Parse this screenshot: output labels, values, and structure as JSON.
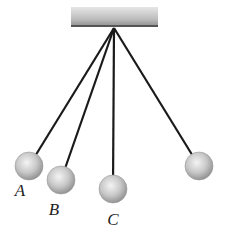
{
  "diagram": {
    "type": "pendulums",
    "support": {
      "x": 71,
      "y": 7,
      "width": 87,
      "height": 20
    },
    "pivot": {
      "x": 114,
      "y": 28
    },
    "string_color": "#1a1a1a",
    "ball_radius": 14,
    "pendulums": [
      {
        "id": "A",
        "label": "A",
        "ball": {
          "x": 29,
          "y": 166
        },
        "label_pos": {
          "x": 20,
          "y": 190
        }
      },
      {
        "id": "B",
        "label": "B",
        "ball": {
          "x": 61,
          "y": 180
        },
        "label_pos": {
          "x": 54,
          "y": 209
        }
      },
      {
        "id": "C",
        "label": "C",
        "ball": {
          "x": 113,
          "y": 189
        },
        "label_pos": {
          "x": 113,
          "y": 219
        }
      },
      {
        "id": "D",
        "label": "",
        "ball": {
          "x": 199,
          "y": 166
        },
        "label_pos": null
      }
    ]
  }
}
